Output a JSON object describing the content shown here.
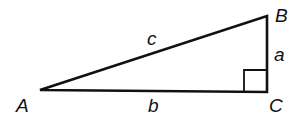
{
  "diagram": {
    "type": "right-triangle",
    "colors": {
      "stroke": "#111111",
      "background": "#ffffff"
    },
    "vertices": [
      {
        "id": "A",
        "label": "A",
        "x": 40,
        "y": 90
      },
      {
        "id": "B",
        "label": "B",
        "x": 267,
        "y": 16
      },
      {
        "id": "C",
        "label": "C",
        "x": 267,
        "y": 92
      }
    ],
    "sides": [
      {
        "id": "c",
        "label": "c",
        "from": "A",
        "to": "B",
        "role": "hypotenuse"
      },
      {
        "id": "a",
        "label": "a",
        "from": "B",
        "to": "C",
        "role": "leg"
      },
      {
        "id": "b",
        "label": "b",
        "from": "A",
        "to": "C",
        "role": "leg"
      }
    ],
    "right_angle_at": "C"
  }
}
